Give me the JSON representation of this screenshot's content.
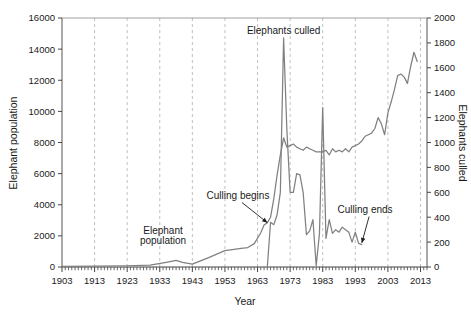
{
  "chart_data": {
    "type": "line",
    "title": "",
    "xlabel": "Year",
    "ylabel": "Elephant population",
    "y2label": "Elephants culled",
    "xlim": [
      1903,
      2015
    ],
    "ylim": [
      0,
      16000
    ],
    "y2lim": [
      0,
      2000
    ],
    "grid": "vertical-dashed",
    "legend": "none (series labelled by annotations)",
    "xticks": [
      1903,
      1913,
      1923,
      1933,
      1943,
      1953,
      1963,
      1973,
      1983,
      1993,
      2003,
      2013
    ],
    "yticks": [
      0,
      2000,
      4000,
      6000,
      8000,
      10000,
      12000,
      14000,
      16000
    ],
    "y2ticks": [
      0,
      200,
      400,
      600,
      800,
      1000,
      1200,
      1400,
      1600,
      1800,
      2000
    ],
    "annotations": [
      {
        "text": "Elephants culled",
        "x": 1971,
        "y": 15000,
        "arrow": false
      },
      {
        "text": "Culling begins",
        "x": 1957,
        "y": 4400,
        "arrow": true,
        "target_x": 1966,
        "target_y": 2850
      },
      {
        "text": "Culling ends",
        "x": 1996,
        "y": 3500,
        "arrow": true,
        "target_x": 1995,
        "target_y": 1550
      },
      {
        "text": "Elephant",
        "x": 1934,
        "y": 2150,
        "arrow": false
      },
      {
        "text": "population",
        "x": 1934,
        "y": 1500,
        "arrow": false
      }
    ],
    "series": [
      {
        "name": "Elephant population",
        "axis": "left",
        "color": "#808080",
        "x": [
          1903,
          1913,
          1923,
          1930,
          1935,
          1938,
          1940,
          1943,
          1948,
          1953,
          1958,
          1960,
          1962,
          1964,
          1965,
          1966,
          1967,
          1968,
          1969,
          1970,
          1971,
          1972,
          1973,
          1974,
          1975,
          1976,
          1977,
          1978,
          1979,
          1980,
          1981,
          1982,
          1983,
          1984,
          1985,
          1986,
          1987,
          1988,
          1989,
          1990,
          1991,
          1992,
          1993,
          1994,
          1995,
          1996,
          1997,
          1998,
          1999,
          2000,
          2001,
          2002,
          2003,
          2004,
          2005,
          2006,
          2007,
          2008,
          2009,
          2010,
          2011,
          2012
        ],
        "y": [
          40,
          60,
          80,
          120,
          300,
          420,
          300,
          180,
          600,
          1050,
          1200,
          1250,
          1500,
          2200,
          2700,
          2850,
          3200,
          4400,
          5900,
          7200,
          8300,
          7700,
          7800,
          7900,
          7700,
          7600,
          7500,
          7700,
          7600,
          7500,
          7400,
          7400,
          7400,
          7500,
          7200,
          7600,
          7400,
          7500,
          7400,
          7600,
          7400,
          7700,
          7800,
          7900,
          8100,
          8400,
          8500,
          8600,
          8900,
          9600,
          9200,
          8500,
          9900,
          10600,
          11400,
          12300,
          12400,
          12200,
          11800,
          12900,
          13800,
          13200
        ],
        "note": "Population stays near zero until 1940s, small bump ~1938, then rises steadily; plateau ~7500 during culling years 1971-1994; rapid rise after culling ends."
      },
      {
        "name": "Elephants culled",
        "axis": "right",
        "color": "#808080",
        "x": [
          1966,
          1967,
          1968,
          1969,
          1970,
          1971,
          1972,
          1973,
          1974,
          1975,
          1976,
          1977,
          1978,
          1979,
          1980,
          1981,
          1982,
          1983,
          1984,
          1985,
          1986,
          1987,
          1988,
          1989,
          1990,
          1991,
          1992,
          1993,
          1994,
          1995
        ],
        "y": [
          0,
          360,
          340,
          420,
          600,
          1840,
          1100,
          600,
          600,
          750,
          740,
          600,
          260,
          290,
          380,
          10,
          270,
          1280,
          230,
          380,
          270,
          300,
          280,
          320,
          300,
          280,
          200,
          280,
          190,
          180
        ],
        "note": "Culling begins 1966/67, peaks at ~1840 in 1971, drops to ~0 in 1981, spikes to ~1280 in 1983, tapers to ~180 by 1995 when culling ends."
      }
    ]
  },
  "axes": {
    "left_title": "Elephant population",
    "right_title": "Elephants culled",
    "x_title": "Year"
  }
}
